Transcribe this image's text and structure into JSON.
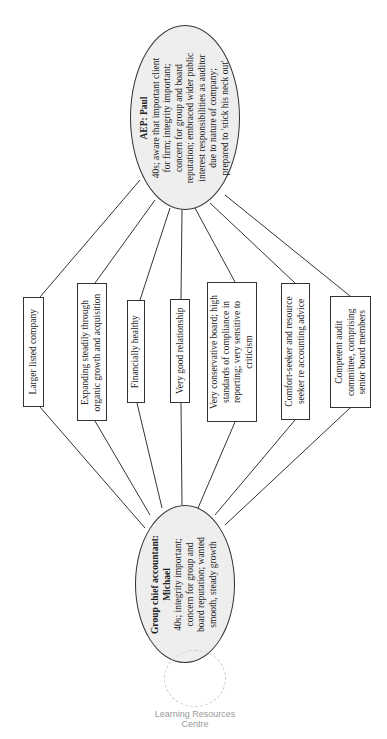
{
  "diagram": {
    "auditor": {
      "title": "AEP: Paul",
      "lines": [
        "40s; aware that important client",
        "for firm; integrity important;",
        "concern for group and board",
        "reputation; embraced wider public",
        "interest responsibilities as auditor",
        "due to nature of company;",
        "prepared to 'stick his neck out'"
      ]
    },
    "client": {
      "title_line1": "Group chief accountant:",
      "title_line2": "Michael",
      "lines": [
        "40s; integrity important;",
        "concern for group and",
        "board reputation; wanted",
        "smooth, steady growth"
      ]
    },
    "factors": [
      {
        "lines": [
          "Larger listed company"
        ]
      },
      {
        "lines": [
          "Expanding steadily through",
          "organic growth and acquisition"
        ]
      },
      {
        "lines": [
          "Financially healthy"
        ]
      },
      {
        "lines": [
          "Very good relationship"
        ]
      },
      {
        "lines": [
          "Very conservative board; high",
          "standards of compliance in",
          "reporting; very sensitive to",
          "criticism"
        ]
      },
      {
        "lines": [
          "Comfort-seeker and resource",
          "seeker re accounting advice"
        ]
      },
      {
        "lines": [
          "Competent audit",
          "committee, comprising",
          "senior board members"
        ]
      }
    ],
    "watermark": {
      "line1": "Learning Resources",
      "line2": "Centre"
    }
  }
}
